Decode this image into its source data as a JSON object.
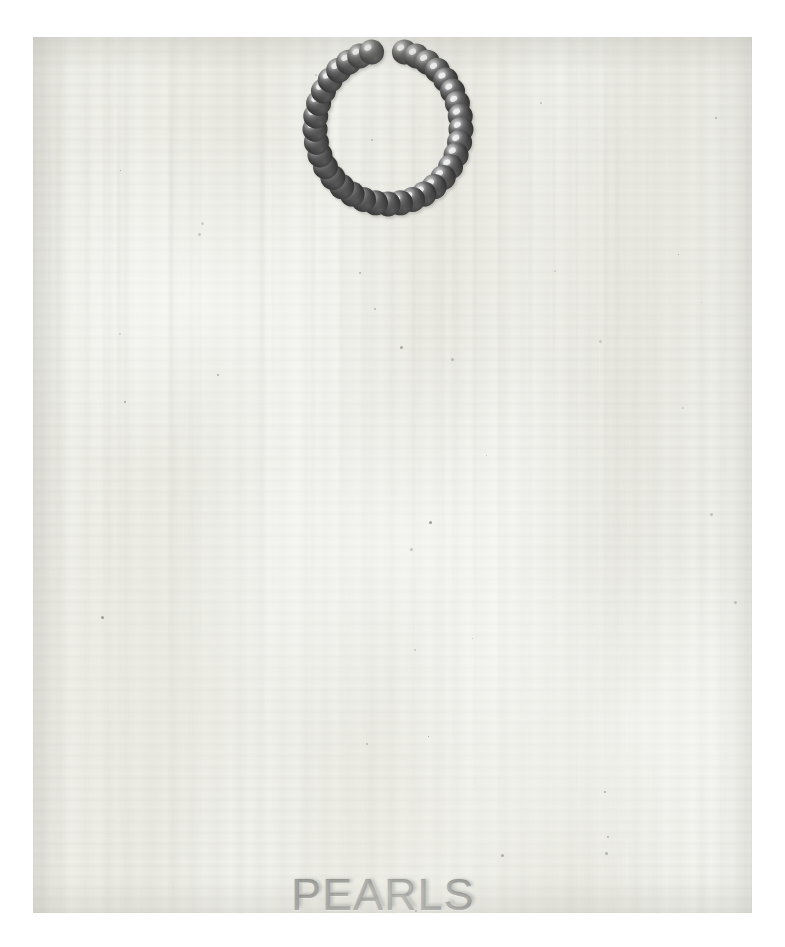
{
  "artwork": {
    "medium_surface": "white painted canvas panel",
    "caption_text": "PEARLS",
    "caption_alt": "PEARLS",
    "background_color": "#ffffff",
    "canvas_color": "#f0f0ea",
    "caption_color": "#80807c",
    "pearl_color": "#3f3f3f",
    "pearl_highlight_color": "#e9e9e9",
    "pearl_shadow_color": "#1d1d1d",
    "necklace": {
      "label": "pearl necklace",
      "bead_count": 35,
      "arrangement": "open ring with gap at top centre",
      "gap_position_deg": 270
    }
  },
  "chart_data": {
    "type": "scatter",
    "title": "PEARLS",
    "xlabel": "",
    "ylabel": "",
    "series": [
      {
        "name": "necklace beads",
        "description": "beads arranged on an open elliptical ring, gap at top centre",
        "count": 35,
        "angles_deg": [
          262,
          270,
          283,
          296,
          309,
          322,
          335,
          348,
          1,
          14,
          27,
          40,
          53,
          66,
          79,
          92,
          105,
          118,
          131,
          144,
          157,
          170,
          183,
          196,
          209,
          222,
          235,
          248,
          255,
          88,
          97,
          73,
          112,
          124,
          277
        ],
        "radius_x": 73,
        "radius_y": 77,
        "bead_radius": 12.5
      }
    ],
    "annotations": [
      {
        "text": "PEARLS",
        "x": 0.5,
        "y": 0.04
      }
    ]
  }
}
